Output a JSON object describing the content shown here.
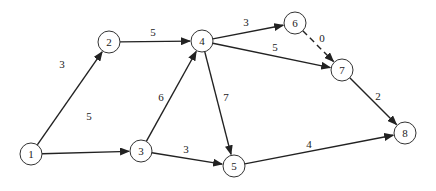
{
  "diagram": {
    "type": "directed-network",
    "node_radius": 11,
    "nodes": [
      {
        "id": "1",
        "label": "1",
        "x": 31,
        "y": 154
      },
      {
        "id": "2",
        "label": "2",
        "x": 109,
        "y": 42
      },
      {
        "id": "3",
        "label": "3",
        "x": 141,
        "y": 151
      },
      {
        "id": "4",
        "label": "4",
        "x": 202,
        "y": 41
      },
      {
        "id": "5",
        "label": "5",
        "x": 234,
        "y": 166
      },
      {
        "id": "6",
        "label": "6",
        "x": 295,
        "y": 23
      },
      {
        "id": "7",
        "label": "7",
        "x": 342,
        "y": 70
      },
      {
        "id": "8",
        "label": "8",
        "x": 405,
        "y": 133
      }
    ],
    "edges": [
      {
        "from": "1",
        "to": "2",
        "weight": "3",
        "dashed": false,
        "label_x": 62,
        "label_y": 68
      },
      {
        "from": "1",
        "to": "3",
        "weight": "5",
        "dashed": false,
        "label_x": 89,
        "label_y": 120
      },
      {
        "from": "2",
        "to": "4",
        "weight": "5",
        "dashed": false,
        "label_x": 153,
        "label_y": 36
      },
      {
        "from": "3",
        "to": "4",
        "weight": "6",
        "dashed": false,
        "label_x": 161,
        "label_y": 101
      },
      {
        "from": "3",
        "to": "5",
        "weight": "3",
        "dashed": false,
        "label_x": 186,
        "label_y": 153
      },
      {
        "from": "4",
        "to": "6",
        "weight": "3",
        "dashed": false,
        "label_x": 246,
        "label_y": 26
      },
      {
        "from": "4",
        "to": "7",
        "weight": "5",
        "dashed": false,
        "label_x": 275,
        "label_y": 51
      },
      {
        "from": "4",
        "to": "5",
        "weight": "7",
        "dashed": false,
        "label_x": 226,
        "label_y": 101
      },
      {
        "from": "6",
        "to": "7",
        "weight": "0",
        "dashed": true,
        "label_x": 322,
        "label_y": 42
      },
      {
        "from": "7",
        "to": "8",
        "weight": "2",
        "dashed": false,
        "label_x": 378,
        "label_y": 100
      },
      {
        "from": "5",
        "to": "8",
        "weight": "4",
        "dashed": false,
        "label_x": 309,
        "label_y": 148
      }
    ]
  }
}
